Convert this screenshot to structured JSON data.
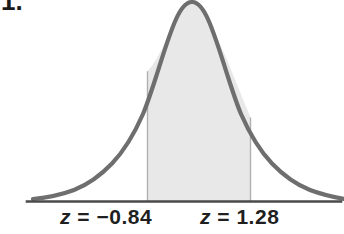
{
  "figure": {
    "item_number": "1.",
    "background_color": "#ffffff",
    "curve_color": "#6e6e6e",
    "shade_color": "#e8e8e8",
    "boundary_line_color": "#b0b0b0",
    "axis_color": "#4a4a4a",
    "text_color": "#1f1f1f"
  },
  "labels": {
    "left": "z = −0.84",
    "right": "z = 1.28"
  },
  "chart_data": {
    "type": "area",
    "title": "",
    "subtitle": "",
    "xlabel": "",
    "ylabel": "",
    "distribution": "standard normal",
    "mean": 0,
    "sd": 1,
    "grid": false,
    "legend": false,
    "xlim": [
      -3.5,
      3.5
    ],
    "ylim": [
      0,
      0.42
    ],
    "shaded_region": {
      "from": -0.84,
      "to": 1.28,
      "fill": "#e8e8e8",
      "labels": [
        "z = −0.84",
        "z = 1.28"
      ]
    },
    "annotations": [
      {
        "text": "z = −0.84",
        "z": -0.84,
        "position": "below-axis"
      },
      {
        "text": "z = 1.28",
        "z": 1.28,
        "position": "below-axis"
      }
    ],
    "tick_labels": [
      "z = −0.84",
      "z = 1.28"
    ],
    "x": [
      -3.5,
      -3.25,
      -3,
      -2.75,
      -2.5,
      -2.25,
      -2,
      -1.75,
      -1.5,
      -1.25,
      -1,
      -0.84,
      -0.75,
      -0.5,
      -0.25,
      0,
      0.25,
      0.5,
      0.75,
      1,
      1.25,
      1.28,
      1.5,
      1.75,
      2,
      2.25,
      2.5,
      2.75,
      3,
      3.25,
      3.5
    ],
    "values": [
      0.0009,
      0.002,
      0.0044,
      0.0091,
      0.0175,
      0.0317,
      0.054,
      0.0863,
      0.1295,
      0.1826,
      0.242,
      0.2803,
      0.3011,
      0.3521,
      0.3867,
      0.3989,
      0.3867,
      0.3521,
      0.3011,
      0.242,
      0.1826,
      0.1758,
      0.1295,
      0.0863,
      0.054,
      0.0317,
      0.0175,
      0.0091,
      0.0044,
      0.002,
      0.0009
    ]
  }
}
